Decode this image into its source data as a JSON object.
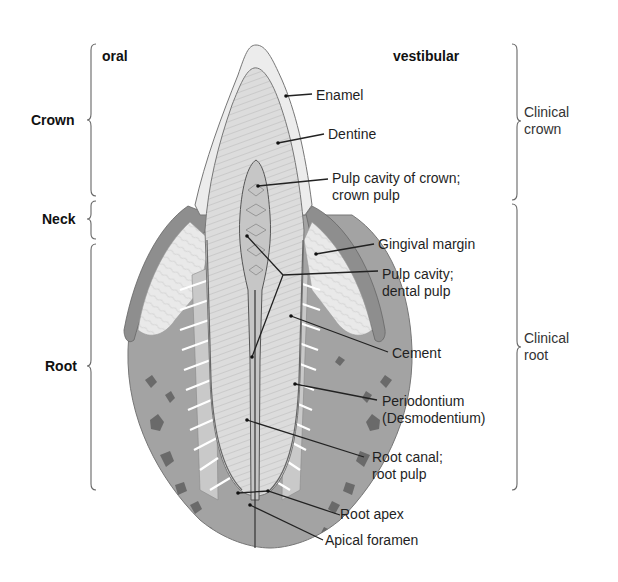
{
  "orientation": {
    "left": "oral",
    "right": "vestibular"
  },
  "left_regions": [
    {
      "label": "Crown",
      "top": 44,
      "bottom": 196
    },
    {
      "label": "Neck",
      "top": 200,
      "bottom": 240
    },
    {
      "label": "Root",
      "top": 244,
      "bottom": 490
    }
  ],
  "right_regions": [
    {
      "label_line1": "Clinical",
      "label_line2": "crown",
      "top": 44,
      "bottom": 200
    },
    {
      "label_line1": "Clinical",
      "label_line2": "root",
      "top": 204,
      "bottom": 490
    }
  ],
  "structures": [
    {
      "label": "Enamel"
    },
    {
      "label": "Dentine"
    },
    {
      "label_line1": "Pulp cavity of crown;",
      "label_line2": "crown pulp"
    },
    {
      "label": "Gingival margin"
    },
    {
      "label_line1": "Pulp cavity;",
      "label_line2": "dental pulp"
    },
    {
      "label": "Cement"
    },
    {
      "label_line1": "Periodontium",
      "label_line2": "(Desmodentium)"
    },
    {
      "label_line1": "Root canal;",
      "label_line2": "root pulp"
    },
    {
      "label": "Root apex"
    },
    {
      "label": "Apical foramen"
    }
  ],
  "colors": {
    "bone": "#9a9a9a",
    "bone_spot": "#5e5e5e",
    "gingiva": "#8c8c8c",
    "gingiva_inner": "#e6e6e6",
    "enamel": "#ececec",
    "dentine": "#d6d6d6",
    "pulp": "#c4c4c4",
    "line": "#222222",
    "brace": "#666666"
  }
}
